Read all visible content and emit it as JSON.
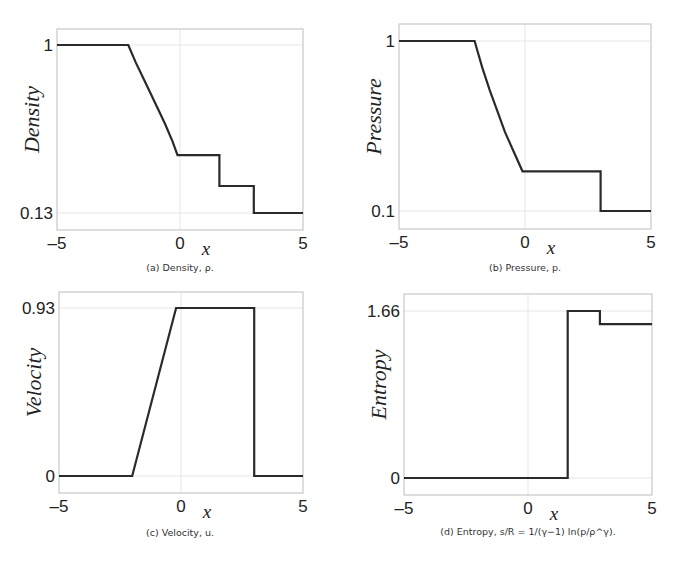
{
  "figure": {
    "panels": [
      {
        "id": "a",
        "caption": "(a) Density, ρ.",
        "ylabel": "Density",
        "xlabel": "x"
      },
      {
        "id": "b",
        "caption": "(b) Pressure, p.",
        "ylabel": "Pressure",
        "xlabel": "x"
      },
      {
        "id": "c",
        "caption": "(c) Velocity, u.",
        "ylabel": "Velocity",
        "xlabel": "x"
      },
      {
        "id": "d",
        "caption": "(d) Entropy, s/R = 1/(γ−1) ln(p/ρ^γ).",
        "ylabel": "Entropy",
        "xlabel": "x"
      }
    ]
  },
  "chart_data": [
    {
      "type": "line",
      "title": "(a) Density, ρ.",
      "xlabel": "x",
      "ylabel": "Density",
      "xlim": [
        -5,
        5
      ],
      "xticks": [
        "-5",
        "0",
        "5"
      ],
      "yticks": [
        "0.13",
        "1"
      ],
      "ytick_values": [
        0.13,
        1
      ],
      "grid": true,
      "frame": {
        "left": 57,
        "top": 29,
        "right": 303,
        "bottom": 230,
        "y_hi_px": 45,
        "y_lo_px": 213
      },
      "x": [
        -5,
        -2.1,
        -1.8,
        -1.5,
        -1.2,
        -0.9,
        -0.6,
        -0.3,
        -0.1,
        1.6,
        1.6,
        3.0,
        3.0,
        5
      ],
      "y": [
        1,
        1,
        0.91,
        0.83,
        0.75,
        0.67,
        0.59,
        0.5,
        0.43,
        0.43,
        0.27,
        0.27,
        0.13,
        0.13
      ]
    },
    {
      "type": "line",
      "title": "(b) Pressure, p.",
      "xlabel": "x",
      "ylabel": "Pressure",
      "xlim": [
        -5,
        5
      ],
      "xticks": [
        "-5",
        "0",
        "5"
      ],
      "yticks": [
        "0.1",
        "1"
      ],
      "ytick_values": [
        0.1,
        1
      ],
      "grid": true,
      "frame": {
        "left": 399,
        "top": 24,
        "right": 651,
        "bottom": 229,
        "y_hi_px": 41,
        "y_lo_px": 211
      },
      "x": [
        -5,
        -2.0,
        -1.7,
        -1.4,
        -1.1,
        -0.8,
        -0.5,
        -0.1,
        3.0,
        3.0,
        5
      ],
      "y": [
        1,
        1,
        0.86,
        0.74,
        0.63,
        0.52,
        0.43,
        0.31,
        0.31,
        0.1,
        0.1
      ]
    },
    {
      "type": "line",
      "title": "(c) Velocity, u.",
      "xlabel": "x",
      "ylabel": "Velocity",
      "xlim": [
        -5,
        5
      ],
      "xticks": [
        "-5",
        "0",
        "5"
      ],
      "yticks": [
        "0",
        "0.93"
      ],
      "ytick_values": [
        0,
        0.93
      ],
      "grid": true,
      "frame": {
        "left": 59,
        "top": 292,
        "right": 303,
        "bottom": 493,
        "y_hi_px": 308,
        "y_lo_px": 476
      },
      "x": [
        -5,
        -2.0,
        -0.2,
        3.0,
        3.0,
        5
      ],
      "y": [
        0,
        0,
        0.93,
        0.93,
        0,
        0
      ]
    },
    {
      "type": "line",
      "title": "(d) Entropy, s/R = 1/(γ−1) ln(p/ρ^γ).",
      "xlabel": "x",
      "ylabel": "Entropy",
      "xlim": [
        -5,
        5
      ],
      "xticks": [
        "-5",
        "0",
        "5"
      ],
      "yticks": [
        "0",
        "1.66"
      ],
      "ytick_values": [
        0,
        1.66
      ],
      "grid": true,
      "frame": {
        "left": 404,
        "top": 294,
        "right": 652,
        "bottom": 495,
        "y_hi_px": 311,
        "y_lo_px": 478
      },
      "x": [
        -5,
        1.6,
        1.6,
        2.9,
        2.9,
        5
      ],
      "y": [
        0,
        0,
        1.66,
        1.66,
        1.53,
        1.53
      ]
    }
  ]
}
